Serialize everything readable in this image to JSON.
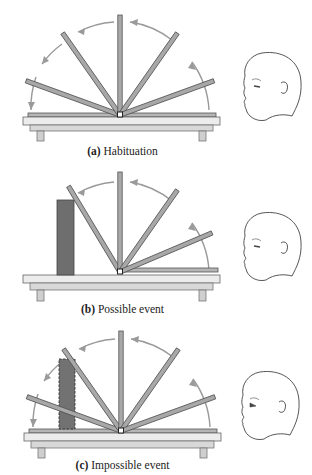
{
  "figure": {
    "panels": [
      {
        "id": "a",
        "letter": "(a)",
        "title": "Habituation",
        "screen_angles_deg": [
          20,
          55,
          90,
          125,
          160
        ],
        "arrows": "full-arc",
        "box": "none"
      },
      {
        "id": "b",
        "letter": "(b)",
        "title": "Possible event",
        "screen_angles_deg": [
          0,
          20,
          55,
          90,
          120
        ],
        "arrows": "stops-at-box",
        "box": "solid"
      },
      {
        "id": "c",
        "letter": "(c)",
        "title": "Impossible event",
        "screen_angles_deg": [
          20,
          55,
          90,
          125,
          160
        ],
        "arrows": "full-arc",
        "box": "dashed"
      }
    ],
    "colors": {
      "screen": "#a8a8a8",
      "screen_edge": "#555555",
      "arrow": "#9a9a9a",
      "box": "#6e6e6e",
      "table_top": "#e8e8e8",
      "table_edge": "#666666",
      "infant_line": "#444444"
    }
  }
}
